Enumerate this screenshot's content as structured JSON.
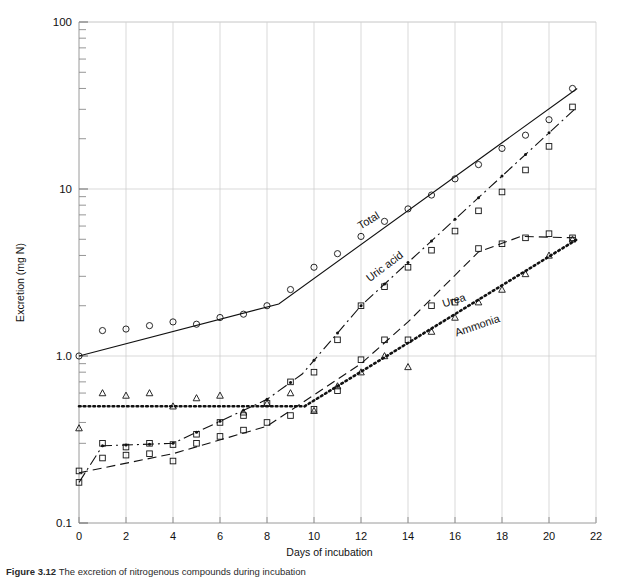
{
  "figure": {
    "caption_prefix": "Figure 3.12",
    "caption_text": "The excretion of nitrogenous compounds during incubation"
  },
  "chart_data": {
    "type": "line",
    "title": "",
    "xlabel": "Days of incubation",
    "ylabel": "Excretion (mg N)",
    "xlim": [
      0,
      22
    ],
    "ylim": [
      0.1,
      100
    ],
    "yscale": "log",
    "grid": true,
    "legend_position": "inline-labels",
    "xticks": [
      0,
      2,
      4,
      6,
      8,
      10,
      12,
      14,
      16,
      18,
      20,
      22
    ],
    "xtick_labels": [
      "0",
      "2",
      "4",
      "6",
      "8",
      "10",
      "12",
      "14",
      "16",
      "18",
      "20",
      "22"
    ],
    "yticks": [
      0.1,
      1.0,
      10,
      100
    ],
    "ytick_labels": [
      "0.1",
      "1.0",
      "10",
      "100"
    ],
    "series": [
      {
        "name": "Total",
        "label": "Total",
        "marker": "open-circle",
        "linestyle": "solid",
        "color": "#111111",
        "label_x": 12.4,
        "label_y": 6.2,
        "label_rotation": -31,
        "fit": [
          [
            0,
            1.0
          ],
          [
            8.5,
            2.05
          ],
          [
            21.2,
            40.0
          ]
        ],
        "points": [
          [
            0,
            1.0
          ],
          [
            1,
            1.42
          ],
          [
            2,
            1.45
          ],
          [
            3,
            1.52
          ],
          [
            4,
            1.6
          ],
          [
            5,
            1.55
          ],
          [
            6,
            1.7
          ],
          [
            7,
            1.78
          ],
          [
            8,
            2.0
          ],
          [
            9,
            2.5
          ],
          [
            10,
            3.4
          ],
          [
            11,
            4.1
          ],
          [
            12,
            5.2
          ],
          [
            13,
            6.4
          ],
          [
            14,
            7.6
          ],
          [
            15,
            9.2
          ],
          [
            16,
            11.5
          ],
          [
            17,
            14.0
          ],
          [
            18,
            17.5
          ],
          [
            19,
            21.0
          ],
          [
            20,
            26.0
          ],
          [
            21,
            40.0
          ]
        ]
      },
      {
        "name": "Uric acid",
        "label": "Uric acid",
        "marker": "open-square",
        "linestyle": "dashdot",
        "color": "#111111",
        "label_x": 13.1,
        "label_y": 3.3,
        "label_rotation": -37,
        "fit": [
          [
            0,
            0.175
          ],
          [
            1,
            0.29
          ],
          [
            4,
            0.3
          ],
          [
            8,
            0.55
          ],
          [
            9.5,
            0.78
          ],
          [
            12,
            2.0
          ],
          [
            21.2,
            31.0
          ]
        ],
        "points": [
          [
            0,
            0.175
          ],
          [
            1,
            0.3
          ],
          [
            2,
            0.285
          ],
          [
            3,
            0.3
          ],
          [
            4,
            0.295
          ],
          [
            5,
            0.34
          ],
          [
            6,
            0.4
          ],
          [
            7,
            0.44
          ],
          [
            8,
            0.52
          ],
          [
            9,
            0.7
          ],
          [
            10,
            0.8
          ],
          [
            11,
            1.25
          ],
          [
            12,
            2.0
          ],
          [
            13,
            2.6
          ],
          [
            14,
            3.4
          ],
          [
            15,
            4.3
          ],
          [
            16,
            5.6
          ],
          [
            17,
            7.4
          ],
          [
            18,
            9.6
          ],
          [
            19,
            13.0
          ],
          [
            20,
            18.0
          ],
          [
            21,
            31.0
          ]
        ]
      },
      {
        "name": "Urea",
        "label": "Urea",
        "marker": "open-square",
        "linestyle": "dashed",
        "color": "#111111",
        "label_x": 16.0,
        "label_y": 2.05,
        "label_rotation": -18,
        "fit": [
          [
            0,
            0.2
          ],
          [
            4,
            0.26
          ],
          [
            8,
            0.38
          ],
          [
            12,
            0.9
          ],
          [
            14,
            1.6
          ],
          [
            17,
            4.2
          ],
          [
            18.8,
            5.2
          ],
          [
            21.2,
            5.1
          ]
        ],
        "points": [
          [
            0,
            0.205
          ],
          [
            1,
            0.245
          ],
          [
            2,
            0.255
          ],
          [
            3,
            0.26
          ],
          [
            4,
            0.235
          ],
          [
            5,
            0.3
          ],
          [
            6,
            0.33
          ],
          [
            7,
            0.36
          ],
          [
            8,
            0.4
          ],
          [
            9,
            0.44
          ],
          [
            10,
            0.48
          ],
          [
            11,
            0.62
          ],
          [
            12,
            0.95
          ],
          [
            13,
            1.25
          ],
          [
            14,
            1.25
          ],
          [
            15,
            2.0
          ],
          [
            16,
            2.1
          ],
          [
            17,
            4.4
          ],
          [
            18,
            4.7
          ],
          [
            19,
            5.1
          ],
          [
            20,
            5.4
          ],
          [
            21,
            5.1
          ]
        ]
      },
      {
        "name": "Ammonia",
        "label": "Ammonia",
        "marker": "open-triangle",
        "linestyle": "dotted",
        "color": "#111111",
        "label_x": 17.0,
        "label_y": 1.45,
        "label_rotation": -19,
        "fit": [
          [
            0,
            0.5
          ],
          [
            9.6,
            0.5
          ],
          [
            21.2,
            5.0
          ]
        ],
        "points": [
          [
            0,
            0.37
          ],
          [
            1,
            0.6
          ],
          [
            2,
            0.58
          ],
          [
            3,
            0.6
          ],
          [
            4,
            0.5
          ],
          [
            5,
            0.56
          ],
          [
            6,
            0.58
          ],
          [
            7,
            0.46
          ],
          [
            8,
            0.52
          ],
          [
            9,
            0.6
          ],
          [
            10,
            0.47
          ],
          [
            11,
            0.66
          ],
          [
            12,
            0.8
          ],
          [
            13,
            1.0
          ],
          [
            14,
            0.86
          ],
          [
            15,
            1.4
          ],
          [
            16,
            1.7
          ],
          [
            17,
            2.1
          ],
          [
            18,
            2.5
          ],
          [
            19,
            3.1
          ],
          [
            20,
            4.0
          ],
          [
            21,
            5.0
          ]
        ]
      }
    ]
  }
}
